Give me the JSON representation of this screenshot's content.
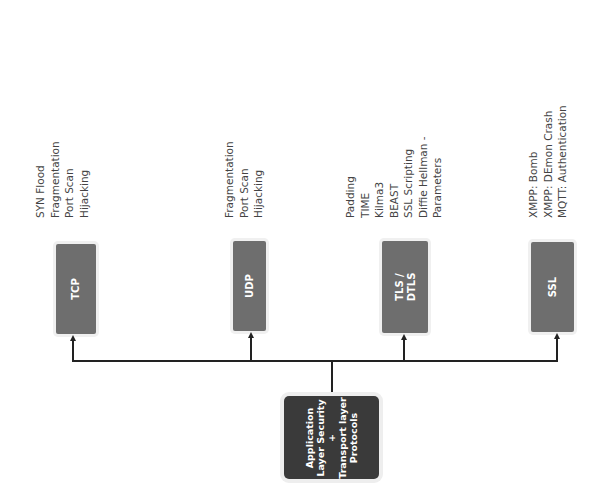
{
  "diagram": {
    "root": {
      "lines": [
        "Application",
        "Layer Security",
        "+",
        "Transport layer",
        "Protocols"
      ]
    },
    "protocols": [
      {
        "name": "TCP",
        "attacks": [
          "SYN Flood",
          "Fragmentation",
          "Port Scan",
          "Hijacking"
        ]
      },
      {
        "name": "UDP",
        "attacks": [
          "Fragmentation",
          "Port Scan",
          "Hijacking"
        ]
      },
      {
        "name_lines": [
          "TLS /",
          "DTLS"
        ],
        "attacks": [
          "Padding",
          "TIME",
          "Kilma3",
          "BEAST",
          "SSL Scripting",
          "Diffie Hellman -",
          "Parameters"
        ]
      },
      {
        "name": "SSL",
        "attacks": [
          "XMPP: Bomb",
          "XMPP: DEmon Crash",
          "MQTT: Authentication"
        ]
      }
    ],
    "colors": {
      "root_box": "#3a3a3a",
      "protocol_box": "#6e6e6e",
      "connector": "#222222",
      "label_text": "#444444"
    }
  }
}
